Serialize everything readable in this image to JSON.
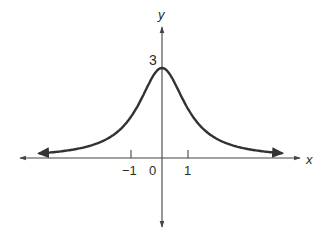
{
  "chart_data": {
    "type": "line",
    "title": "",
    "xlabel": "x",
    "ylabel": "y",
    "function": "y = 3/(1+x^2)",
    "x_ticks": [
      {
        "value": -1,
        "label": "−1"
      },
      {
        "value": 0,
        "label": "0"
      },
      {
        "value": 1,
        "label": "1"
      }
    ],
    "y_annotations": [
      {
        "value": 3,
        "label": "3"
      }
    ],
    "series": [
      {
        "name": "curve",
        "x": [
          -4.5,
          -4,
          -3,
          -2,
          -1.5,
          -1,
          -0.5,
          0,
          0.5,
          1,
          1.5,
          2,
          3,
          4,
          4.2
        ],
        "y": [
          0.14,
          0.18,
          0.3,
          0.6,
          0.92,
          1.5,
          2.4,
          3,
          2.4,
          1.5,
          0.92,
          0.6,
          0.3,
          0.18,
          0.16
        ]
      }
    ],
    "xlim": [
      -5.2,
      4.9
    ],
    "ylim": [
      -2.3,
      4.4
    ],
    "grid": false,
    "legend": null,
    "arrows": {
      "curve_ends": true,
      "x_axis_both_ends": true,
      "y_axis_both_ends": true
    },
    "colors": {
      "curve": "#333333",
      "axes": "#444444",
      "text": "#2a2a2a"
    }
  },
  "labels": {
    "x_axis": "x",
    "y_axis": "y",
    "peak": "3",
    "tick_neg1": "−1",
    "tick_0": "0",
    "tick_1": "1"
  }
}
